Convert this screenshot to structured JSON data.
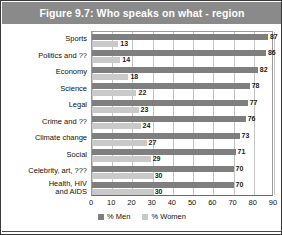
{
  "figure": {
    "title": "Figure 9.7: Who speaks on what - region",
    "title_bg": "#8a8a8a",
    "title_color": "#ffffff"
  },
  "legend": {
    "position": "bottom-center",
    "items": [
      {
        "label": "% Men",
        "color": "#7f7f7f"
      },
      {
        "label": "% Women",
        "color": "#c9c9c9"
      }
    ]
  },
  "chart_data": {
    "type": "bar",
    "orientation": "horizontal",
    "title": "Figure 9.7: Who speaks on what - region",
    "xlabel": "",
    "ylabel": "",
    "xlim": [
      0,
      90
    ],
    "xticks": [
      0,
      10,
      20,
      30,
      40,
      50,
      60,
      70,
      80,
      90
    ],
    "xtick_labels": [
      "0",
      "10",
      "20",
      "30",
      "40",
      "50",
      "60",
      "70",
      "80",
      "90"
    ],
    "grid": true,
    "grid_axis": "x",
    "legend_position": "bottom-center",
    "categories": [
      "Sports",
      "Politics and ??",
      "Economy",
      "Science",
      "Legal",
      "Crime and ??",
      "Climate change",
      "Social",
      "Celebrity, art, ???",
      "Health, HIV\nand AIDS"
    ],
    "series": [
      {
        "name": "% Men",
        "color": "#7f7f7f",
        "values": [
          87,
          86,
          82,
          78,
          77,
          76,
          73,
          71,
          70,
          70
        ]
      },
      {
        "name": "% Women",
        "color": "#c9c9c9",
        "values": [
          13,
          14,
          18,
          22,
          23,
          24,
          27,
          29,
          30,
          30
        ]
      }
    ]
  }
}
